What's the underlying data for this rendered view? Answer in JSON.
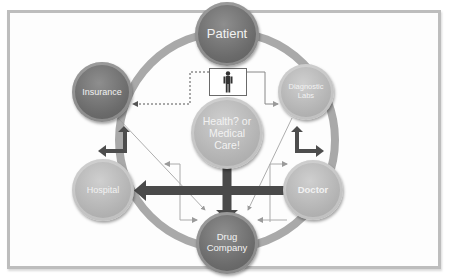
{
  "diagram": {
    "center": {
      "label": "Health? or\nMedical\nCare!"
    },
    "nodes": [
      {
        "id": "patient",
        "label": "Patient"
      },
      {
        "id": "insurance",
        "label": "Insurance"
      },
      {
        "id": "diagnostic-labs",
        "label": "Diagnostic\nLabs"
      },
      {
        "id": "hospital",
        "label": "Hospital"
      },
      {
        "id": "doctor",
        "label": "Doctor"
      },
      {
        "id": "drug-company",
        "label": "Drug\nCompany"
      }
    ],
    "icons": {
      "person": "human-figure-icon"
    },
    "colors": {
      "dark_node": "#6b6b6b",
      "light_node": "#b3b3b3",
      "ring": "#a8a8a8",
      "arrow": "#4a4a4a",
      "frame_border": "#bdbdbd"
    }
  }
}
